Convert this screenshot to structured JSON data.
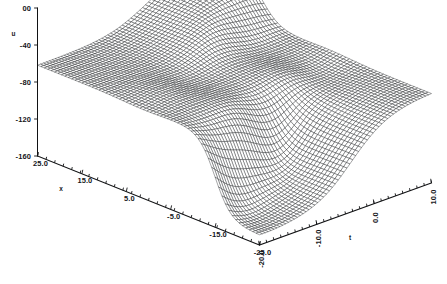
{
  "figure": {
    "kind": "3d-wireframe-surface",
    "background": "#ffffff",
    "line_color": "#111214",
    "title": ""
  },
  "axes": {
    "z": {
      "name": "u",
      "tick_labels": [
        "00",
        "-40",
        "-80",
        "-120",
        "-160"
      ],
      "tick_values": [
        0,
        -40,
        -80,
        -120,
        -160
      ],
      "range": [
        -160,
        0
      ],
      "orientation": "vertical-left",
      "label_rotation": -90
    },
    "x": {
      "name": "x",
      "tick_labels": [
        "25.0",
        "15.0",
        "5.0",
        "-5.0",
        "-15.0",
        "-25.0"
      ],
      "tick_values": [
        25.0,
        15.0,
        5.0,
        -5.0,
        -15.0,
        -25.0
      ],
      "range": [
        -25.0,
        25.0
      ],
      "orientation": "front-left-diagonal",
      "label_rotation": 0
    },
    "t": {
      "name": "t",
      "tick_labels": [
        "10.0",
        "0.0",
        "-10.0",
        "-20.0"
      ],
      "tick_values": [
        10.0,
        0.0,
        -10.0,
        -20.0
      ],
      "range": [
        -20.0,
        10.0
      ],
      "orientation": "front-right-diagonal",
      "label_rotation": -90
    }
  },
  "chart_data": {
    "type": "surface",
    "title": "",
    "xlabel": "x",
    "ylabel": "t",
    "zlabel": "u",
    "xlim": [
      -25.0,
      25.0
    ],
    "ylim": [
      -20.0,
      10.0
    ],
    "zlim": [
      -160.0,
      0.0
    ],
    "grid": false,
    "legend": "none",
    "mesh": {
      "nx": 66,
      "nt": 60,
      "style": "wireframe",
      "hidden_line_removal": true
    },
    "surface_model": {
      "description": "Two interacting kink/soliton fronts on a depressed background; background plateau near u = -62, deep trough near u = -150 on the far-x side, raised ridge plateau near u = -18 on the near-t side.",
      "baseline": -62,
      "trough_depth": -150,
      "ridge_height": -14,
      "kink_slope": 0.55,
      "kink_center_a": -7.0,
      "kink_center_b": 9.0,
      "t_drift": 0.95
    }
  },
  "projection": {
    "origin_px": [
      259.5,
      245.0
    ],
    "x_axis_vec_px": [
      -222.0,
      -89.0
    ],
    "t_axis_vec_px": [
      172.0,
      -62.0
    ],
    "z_axis_len_px": 148.0
  }
}
